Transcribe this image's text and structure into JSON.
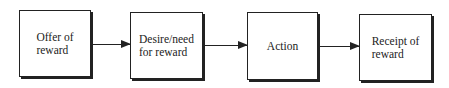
{
  "diagram": {
    "type": "flowchart",
    "nodes": [
      {
        "id": "offer",
        "label": "Offer of\nreward"
      },
      {
        "id": "desire",
        "label": "Desire/need\nfor reward"
      },
      {
        "id": "action",
        "label": "Action"
      },
      {
        "id": "receipt",
        "label": "Receipt of\nreward"
      }
    ],
    "edges": [
      {
        "from": "offer",
        "to": "desire"
      },
      {
        "from": "desire",
        "to": "action"
      },
      {
        "from": "action",
        "to": "receipt"
      }
    ]
  }
}
